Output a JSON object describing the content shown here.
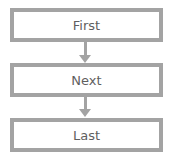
{
  "diagram": {
    "type": "flowchart",
    "direction": "top-to-bottom",
    "nodes": [
      {
        "id": "first",
        "label": "First"
      },
      {
        "id": "next",
        "label": "Next"
      },
      {
        "id": "last",
        "label": "Last"
      }
    ],
    "edges": [
      {
        "from": "first",
        "to": "next"
      },
      {
        "from": "next",
        "to": "last"
      }
    ],
    "colors": {
      "border": "#a3a3a3",
      "text": "#5f5f5f",
      "background": "#ffffff"
    }
  }
}
